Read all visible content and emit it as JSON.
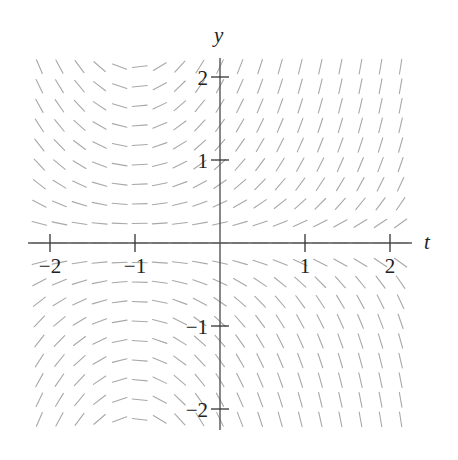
{
  "chart_data": {
    "type": "slope_field",
    "title": "",
    "equation_inferred": "dy/dt = (t + 1) y",
    "xlabel": "t",
    "ylabel": "y",
    "xlim": [
      -2.15,
      2.2
    ],
    "ylim": [
      -2.25,
      2.25
    ],
    "xticks": [
      {
        "value": -2,
        "label": "−2"
      },
      {
        "value": -1,
        "label": "−1"
      },
      {
        "value": 1,
        "label": "1"
      },
      {
        "value": 2,
        "label": "2"
      }
    ],
    "yticks": [
      {
        "value": 2,
        "label": "2"
      },
      {
        "value": 1,
        "label": "1"
      },
      {
        "value": -1,
        "label": "−1"
      },
      {
        "value": -2,
        "label": "−2"
      }
    ],
    "grid_t": {
      "start": -2.125,
      "end": 2.125,
      "count": 19
    },
    "grid_y": {
      "start": -2.125,
      "end": 2.125,
      "count": 19
    },
    "segment_color": "#a8a8a8",
    "axis_color": "#555555",
    "grid": false,
    "legend": null
  },
  "layout": {
    "origin_px": [
      220,
      243
    ],
    "px_per_unit_t": 85,
    "px_per_unit_y": 83,
    "segment_len_px": 15
  }
}
